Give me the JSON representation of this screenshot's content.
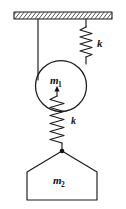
{
  "figure": {
    "background_color": "#ffffff",
    "ink_color": "#1a1a1a"
  },
  "ceiling": {
    "label": "ceiling-support",
    "hatch_style": "diagonal",
    "x": 14,
    "y": 12,
    "width": 98,
    "height": 7
  },
  "labels": {
    "mass_top": "m",
    "mass_top_sub": "1",
    "mass_bottom": "m",
    "mass_bottom_sub": "2",
    "spring_right": "k",
    "spring_lower": "k"
  },
  "elements": {
    "rope_left": "rope-left",
    "rope_right_stub": "rope-right-stub",
    "pulley": "pulley-circle",
    "spring_right": "spring-right",
    "spring_lower": "spring-lower",
    "mass_block": "mass-pentagon",
    "arrow_m1": "arrow-to-m1",
    "junction_dot": "junction-dot"
  },
  "geometry": {
    "pulley_center_x": 61,
    "pulley_center_y": 86,
    "pulley_radius": 26,
    "rope_left_x": 38,
    "rope_right_x": 86,
    "spring_right_top_y": 26,
    "spring_right_bottom_y": 58,
    "spring_lower_top_y": 96,
    "spring_lower_bottom_y": 150,
    "mass_apex_x": 62,
    "mass_apex_y": 151,
    "mass_left_x": 27,
    "mass_right_x": 97,
    "mass_shoulder_y": 172,
    "mass_bottom_y": 200
  }
}
